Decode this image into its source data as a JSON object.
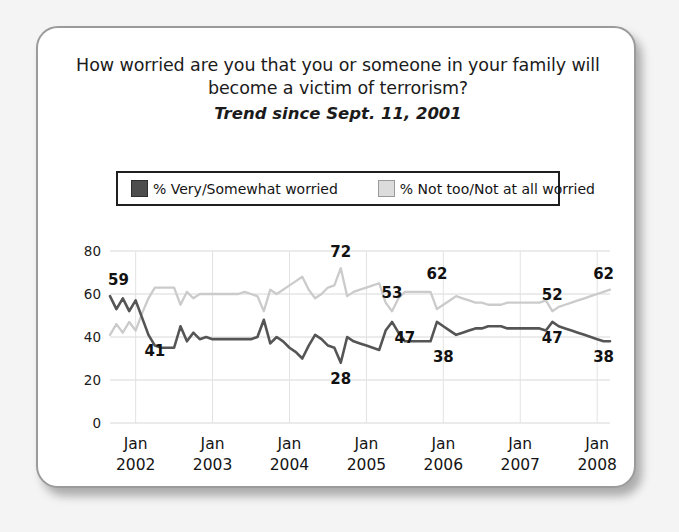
{
  "card": {
    "title_line1": "How worried are you that you or someone in your family will",
    "title_line2": "become a victim of terrorism?",
    "subtitle": "Trend since Sept. 11, 2001"
  },
  "legend": {
    "items": [
      {
        "label": "% Very/Somewhat worried",
        "swatch": "dark",
        "color": "#4d4d4d"
      },
      {
        "label": "% Not too/Not at all worried",
        "swatch": "light",
        "color": "#dcdcdc"
      }
    ]
  },
  "chart_data": {
    "type": "line",
    "title": "How worried are you that you or someone in your family will become a victim of terrorism?",
    "subtitle": "Trend since Sept. 11, 2001",
    "xlabel": "",
    "ylabel": "",
    "ylim": [
      0,
      80
    ],
    "yticks": [
      0,
      20,
      40,
      60,
      80
    ],
    "ytick_labels": [
      "0",
      "20",
      "40",
      "60",
      "80"
    ],
    "xtick_labels": [
      {
        "month": "Jan",
        "year": "2002"
      },
      {
        "month": "Jan",
        "year": "2003"
      },
      {
        "month": "Jan",
        "year": "2004"
      },
      {
        "month": "Jan",
        "year": "2005"
      },
      {
        "month": "Jan",
        "year": "2006"
      },
      {
        "month": "Jan",
        "year": "2007"
      },
      {
        "month": "Jan",
        "year": "2008"
      }
    ],
    "grid": true,
    "legend_position": "top",
    "xlim": [
      0,
      78
    ],
    "xtick_positions": [
      4,
      16,
      28,
      40,
      52,
      64,
      76
    ],
    "series": [
      {
        "name": "% Very/Somewhat worried",
        "color": "#555555",
        "x": [
          0,
          1,
          2,
          3,
          4,
          5,
          6,
          7,
          8,
          9,
          10,
          11,
          12,
          13,
          14,
          15,
          16,
          17,
          18,
          19,
          20,
          21,
          22,
          23,
          24,
          25,
          26,
          27,
          28,
          29,
          30,
          31,
          32,
          33,
          34,
          35,
          36,
          37,
          38,
          39,
          40,
          41,
          42,
          43,
          44,
          45,
          46,
          47,
          48,
          49,
          50,
          51,
          52,
          53,
          54,
          55,
          56,
          57,
          58,
          59,
          60,
          61,
          62,
          63,
          64,
          65,
          66,
          67,
          68,
          69,
          70,
          71,
          72,
          73,
          74,
          75,
          76,
          77,
          78
        ],
        "values": [
          59,
          53,
          58,
          52,
          57,
          49,
          41,
          36,
          35,
          35,
          35,
          45,
          38,
          42,
          39,
          40,
          39,
          39,
          39,
          39,
          39,
          39,
          39,
          40,
          48,
          37,
          40,
          38,
          35,
          33,
          30,
          36,
          41,
          39,
          36,
          35,
          28,
          40,
          38,
          37,
          36,
          35,
          34,
          43,
          47,
          42,
          38,
          38,
          38,
          38,
          38,
          47,
          45,
          43,
          41,
          42,
          43,
          44,
          44,
          45,
          45,
          45,
          44,
          44,
          44,
          44,
          44,
          44,
          43,
          47,
          45,
          44,
          43,
          42,
          41,
          40,
          39,
          38,
          38
        ],
        "labels": [
          {
            "x": 0,
            "value": 59,
            "text": "59",
            "position": "above"
          },
          {
            "x": 7,
            "value": 41,
            "text": "41",
            "position": "below"
          },
          {
            "x": 36,
            "value": 28,
            "text": "28",
            "position": "below"
          },
          {
            "x": 46,
            "value": 47,
            "text": "47",
            "position": "below"
          },
          {
            "x": 52,
            "value": 38,
            "text": "38",
            "position": "below"
          },
          {
            "x": 69,
            "value": 47,
            "text": "47",
            "position": "below"
          },
          {
            "x": 78,
            "value": 38,
            "text": "38",
            "position": "below"
          }
        ]
      },
      {
        "name": "% Not too/Not at all worried",
        "color": "#cbcbcb",
        "x": [
          0,
          1,
          2,
          3,
          4,
          5,
          6,
          7,
          8,
          9,
          10,
          11,
          12,
          13,
          14,
          15,
          16,
          17,
          18,
          19,
          20,
          21,
          22,
          23,
          24,
          25,
          26,
          27,
          28,
          29,
          30,
          31,
          32,
          33,
          34,
          35,
          36,
          37,
          38,
          39,
          40,
          41,
          42,
          43,
          44,
          45,
          46,
          47,
          48,
          49,
          50,
          51,
          52,
          53,
          54,
          55,
          56,
          57,
          58,
          59,
          60,
          61,
          62,
          63,
          64,
          65,
          66,
          67,
          68,
          69,
          70,
          71,
          72,
          73,
          74,
          75,
          76,
          77,
          78
        ],
        "values": [
          41,
          46,
          42,
          47,
          43,
          51,
          58,
          63,
          63,
          63,
          63,
          55,
          61,
          58,
          60,
          60,
          60,
          60,
          60,
          60,
          60,
          61,
          60,
          59,
          52,
          62,
          60,
          62,
          64,
          66,
          68,
          62,
          58,
          60,
          63,
          64,
          72,
          59,
          61,
          62,
          63,
          64,
          65,
          56,
          52,
          58,
          61,
          61,
          61,
          61,
          61,
          53,
          55,
          57,
          59,
          58,
          57,
          56,
          56,
          55,
          55,
          55,
          56,
          56,
          56,
          56,
          56,
          56,
          57,
          52,
          54,
          55,
          56,
          57,
          58,
          59,
          60,
          61,
          62
        ],
        "labels": [
          {
            "x": 36,
            "value": 72,
            "text": "72",
            "position": "above"
          },
          {
            "x": 44,
            "value": 53,
            "text": "53",
            "position": "above"
          },
          {
            "x": 51,
            "value": 62,
            "text": "62",
            "position": "above"
          },
          {
            "x": 69,
            "value": 52,
            "text": "52",
            "position": "above"
          },
          {
            "x": 78,
            "value": 62,
            "text": "62",
            "position": "above"
          }
        ]
      }
    ]
  }
}
